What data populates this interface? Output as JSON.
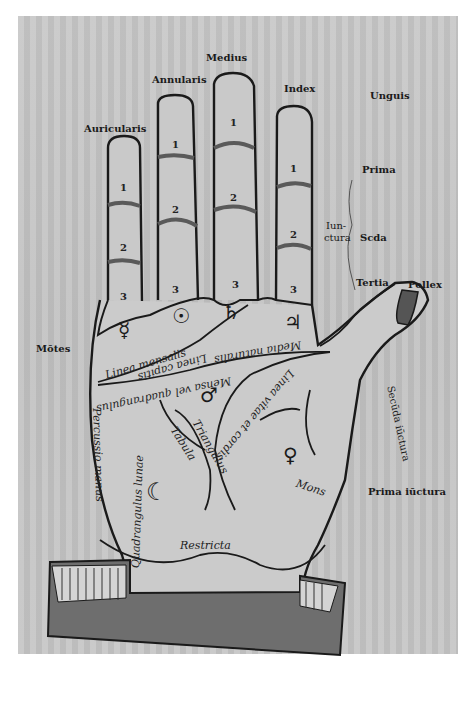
{
  "image": {
    "description": "Woodcut palmistry diagram of a left hand with Latin labels",
    "paper_color": "#c6c6c6",
    "ink_color": "#1a1a1a",
    "cuff_color": "#6e6e6e"
  },
  "fingers": {
    "auricularis": "Auricularis",
    "annularis": "Annularis",
    "medius": "Medius",
    "index": "Index",
    "pollex": "Pollex"
  },
  "joints": {
    "unguis": "Unguis",
    "prima": "Prima",
    "iunctura_1": "Iun-",
    "iunctura_2": "ctura",
    "secunda": "Scda",
    "tertia": "Tertia",
    "secunda_iunctura": "Secūda iūctura",
    "prima_iunctura": "Prima iūctura"
  },
  "margin": {
    "montes": "Mōtes"
  },
  "phalanx_numbers": {
    "one": "1",
    "two": "2",
    "three": "3"
  },
  "planet_symbols": {
    "mercury": "☿",
    "sun": "☉",
    "saturn": "♄",
    "jupiter": "♃",
    "mars": "♂",
    "venus": "♀",
    "moon": "☾"
  },
  "palm_lines": {
    "linea_mensalis": "Linea mensalis",
    "linea_capitis": "Linea capitis",
    "media_naturalis": "Media naturalis",
    "mensalis_quadrangulus": "Mensa vel quadrangulus",
    "linea_vitae": "Linea vitae et cordis",
    "triangulus": "Triangulus",
    "tabula": "Tabula",
    "percussio_manus": "Percussio manus",
    "quadrangulus_lunae": "Quadrangulus lunae",
    "mons": "Mons",
    "restricta": "Restricta"
  }
}
